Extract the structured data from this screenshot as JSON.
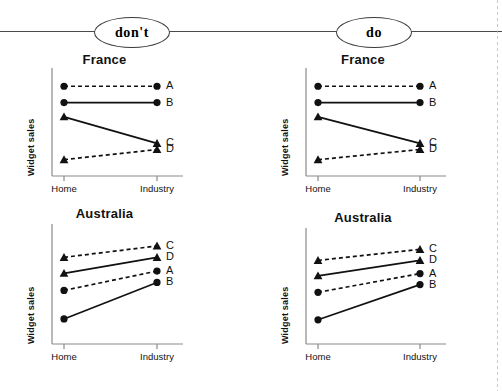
{
  "figure": {
    "badges": [
      {
        "id": "dont",
        "label": "don't"
      },
      {
        "id": "do",
        "label": "do"
      }
    ]
  },
  "chart_data": [
    {
      "id": "dont-france",
      "panel": "don't",
      "type": "line",
      "title": "France",
      "xlabel": "",
      "ylabel": "Widget sales",
      "categories": [
        "Home",
        "Industry"
      ],
      "x": [
        "Home",
        "Industry"
      ],
      "grid": false,
      "legend": "right-of-endpoint",
      "ylim": [
        0,
        100
      ],
      "series": [
        {
          "name": "A",
          "values": [
            88,
            88
          ],
          "marker": "circle",
          "style": "dashed"
        },
        {
          "name": "B",
          "values": [
            72,
            72
          ],
          "marker": "circle",
          "style": "solid"
        },
        {
          "name": "C",
          "values": [
            58,
            32
          ],
          "marker": "triangle",
          "style": "solid"
        },
        {
          "name": "D",
          "values": [
            16,
            26
          ],
          "marker": "triangle",
          "style": "dashed"
        }
      ],
      "endpoint_labels": {
        "left": [
          "A",
          "B",
          "C",
          "D"
        ],
        "right": [
          "A",
          "B",
          "C",
          "D"
        ]
      },
      "note": "solid C falls to lower-right labelled D; dashed D rises to upper-right labelled C"
    },
    {
      "id": "dont-australia",
      "panel": "don't",
      "type": "line",
      "title": "Australia",
      "xlabel": "",
      "ylabel": "Widget sales",
      "categories": [
        "Home",
        "Industry"
      ],
      "x": [
        "Home",
        "Industry"
      ],
      "grid": false,
      "legend": "right-of-endpoint",
      "ylim": [
        0,
        100
      ],
      "series": [
        {
          "name": "C",
          "values": [
            76,
            86
          ],
          "marker": "triangle",
          "style": "dashed"
        },
        {
          "name": "D",
          "values": [
            62,
            76
          ],
          "marker": "triangle",
          "style": "solid"
        },
        {
          "name": "A",
          "values": [
            47,
            64
          ],
          "marker": "circle",
          "style": "dashed"
        },
        {
          "name": "B",
          "values": [
            22,
            54
          ],
          "marker": "circle",
          "style": "solid"
        }
      ],
      "endpoint_labels": {
        "right": [
          "C",
          "D",
          "A",
          "B"
        ]
      }
    },
    {
      "id": "do-france",
      "panel": "do",
      "type": "line",
      "title": "France",
      "xlabel": "",
      "ylabel": "Widget sales",
      "categories": [
        "Home",
        "Industry"
      ],
      "x": [
        "Home",
        "Industry"
      ],
      "grid": false,
      "legend": "right-of-endpoint",
      "ylim": [
        0,
        100
      ],
      "series": [
        {
          "name": "A",
          "values": [
            88,
            88
          ],
          "marker": "circle",
          "style": "dashed"
        },
        {
          "name": "B",
          "values": [
            72,
            72
          ],
          "marker": "circle",
          "style": "solid"
        },
        {
          "name": "C",
          "values": [
            58,
            32
          ],
          "marker": "triangle",
          "style": "solid"
        },
        {
          "name": "D",
          "values": [
            16,
            26
          ],
          "marker": "triangle",
          "style": "dashed"
        }
      ],
      "endpoint_labels": {
        "right": [
          "A",
          "B",
          "C",
          "D"
        ]
      }
    },
    {
      "id": "do-australia",
      "panel": "do",
      "type": "line",
      "title": "Australia",
      "xlabel": "",
      "ylabel": "Widget sales",
      "categories": [
        "Home",
        "Industry"
      ],
      "x": [
        "Home",
        "Industry"
      ],
      "grid": false,
      "legend": "right-of-endpoint",
      "ylim": [
        0,
        100
      ],
      "series": [
        {
          "name": "C",
          "values": [
            76,
            86
          ],
          "marker": "triangle",
          "style": "dashed"
        },
        {
          "name": "D",
          "values": [
            62,
            76
          ],
          "marker": "triangle",
          "style": "solid"
        },
        {
          "name": "A",
          "values": [
            47,
            64
          ],
          "marker": "circle",
          "style": "dashed"
        },
        {
          "name": "B",
          "values": [
            22,
            54
          ],
          "marker": "circle",
          "style": "solid"
        }
      ],
      "endpoint_labels": {
        "right": [
          "C",
          "D",
          "A",
          "B"
        ]
      }
    }
  ],
  "axis_labels": {
    "y": "Widget sales",
    "x_ticks": [
      "Home",
      "Industry"
    ]
  },
  "colors": {
    "ink": "#111111",
    "rule": "#4a4a4a",
    "axis": "#8a8a8a",
    "background": "#ffffff"
  }
}
